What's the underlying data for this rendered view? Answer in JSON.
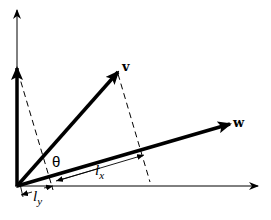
{
  "diagram": {
    "type": "vector-projection",
    "colors": {
      "stroke": "#000000",
      "background": "#ffffff"
    },
    "labels": {
      "v": "v",
      "w": "w",
      "theta": "θ",
      "lx_base": "l",
      "lx_sub": "x",
      "ly_base": "l",
      "ly_sub": "y"
    },
    "elements": [
      {
        "name": "y-axis",
        "style": "thin-arrow"
      },
      {
        "name": "x-axis",
        "style": "thin-arrow"
      },
      {
        "name": "vertical-vector",
        "style": "thick-arrow"
      },
      {
        "name": "vector-v",
        "style": "thick-arrow",
        "label": "v"
      },
      {
        "name": "vector-w",
        "style": "thick-arrow",
        "label": "w"
      },
      {
        "name": "projection-dashed-from-vertical",
        "style": "dashed"
      },
      {
        "name": "projection-dashed-from-v",
        "style": "dashed"
      },
      {
        "name": "angle-theta",
        "label": "θ"
      },
      {
        "name": "dimension-lx",
        "label": "l_x"
      },
      {
        "name": "dimension-ly",
        "label": "l_y"
      }
    ]
  }
}
